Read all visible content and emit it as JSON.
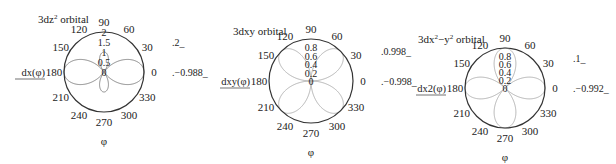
{
  "chart_data": [
    {
      "type": "polar",
      "title": "3dz² orbital",
      "title_main": "3dz",
      "title_sup": "2",
      "title_rest": " orbital",
      "function_label": "dx(φ)",
      "xlabel": "φ",
      "angle_ticks": [
        "0",
        "30",
        "60",
        "90",
        "120",
        "150",
        "180",
        "210",
        "240",
        "270",
        "300",
        "330"
      ],
      "radial_ticks": [
        "0",
        "0.5",
        "1",
        "1.5",
        "2"
      ],
      "rlim": [
        0,
        2
      ],
      "side_labels": {
        "upper": ".2_",
        "lower": ".−0.988_"
      },
      "center": [
        104,
        72
      ],
      "radius": 40,
      "series": [
        {
          "name": "dz2",
          "formula": "|3cos²φ−1|",
          "description": "two large lobes along 0°/180° reaching r=2, small lobes along 90°/270° reaching r≈1"
        }
      ]
    },
    {
      "type": "polar",
      "title": "3dxy orbital",
      "title_main": "3dxy",
      "title_sup": "",
      "title_rest": " orbital",
      "function_label": "dxy(φ)",
      "xlabel": "φ",
      "angle_ticks": [
        "0",
        "30",
        "60",
        "90",
        "120",
        "150",
        "180",
        "210",
        "240",
        "270",
        "300",
        "330"
      ],
      "radial_ticks": [
        "0",
        "0.2",
        "0.4",
        "0.6",
        "0.8"
      ],
      "rlim": [
        0,
        1
      ],
      "side_labels": {
        "upper": ".0.998_",
        "lower": ".−0.998_"
      },
      "center": [
        311,
        81
      ],
      "radius": 42,
      "series": [
        {
          "name": "dxy",
          "formula": "|sin 2φ|",
          "description": "four lobes at 45°, 135°, 225°, 315° reaching r=1"
        }
      ]
    },
    {
      "type": "polar",
      "title": "3dx²−y² orbital",
      "title_main": "3dx",
      "title_sup": "2",
      "title_mid": "−y",
      "title_sup2": "2",
      "title_rest": " orbital",
      "function_label": "dx2(φ)",
      "xlabel": "φ",
      "angle_ticks": [
        "0",
        "30",
        "60",
        "90",
        "120",
        "150",
        "180",
        "210",
        "240",
        "270",
        "300",
        "330"
      ],
      "radial_ticks": [
        "0",
        "0.2",
        "0.4",
        "0.6",
        "0.8"
      ],
      "rlim": [
        0,
        1
      ],
      "side_labels": {
        "upper": ".1_",
        "lower": ".−0.992_",
        "zero_extra": "0"
      },
      "center": [
        505,
        88
      ],
      "radius": 40,
      "series": [
        {
          "name": "dx2-y2",
          "formula": "|cos 2φ|",
          "description": "four lobes at 0°, 90°, 180°, 270° reaching r=1"
        }
      ]
    }
  ]
}
